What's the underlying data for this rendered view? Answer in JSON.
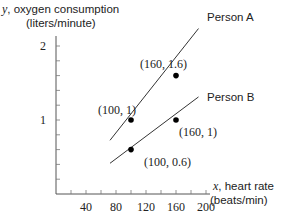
{
  "chart_data": {
    "type": "line",
    "title": "",
    "xlabel": "x, heart rate (beats/min)",
    "ylabel": "y, oxygen consumption (liters/minute)",
    "xlabel_var": "x",
    "xlabel_line1": ", heart rate",
    "xlabel_line2": "(beats/min)",
    "ylabel_var": "y",
    "ylabel_line1": ", oxygen consumption",
    "ylabel_line2": "(liters/minute)",
    "xlim": [
      0,
      200
    ],
    "ylim": [
      0,
      2
    ],
    "x_ticks": [
      20,
      40,
      60,
      80,
      100,
      120,
      140,
      160,
      180,
      200
    ],
    "x_tick_labels": [
      "40",
      "80",
      "120",
      "160",
      "200"
    ],
    "y_ticks": [
      0.2,
      0.4,
      0.6,
      0.8,
      1.0,
      1.2,
      1.4,
      1.6,
      1.8,
      2.0
    ],
    "y_tick_labels": [
      "1",
      "2"
    ],
    "grid": false,
    "series": [
      {
        "name": "Person A",
        "line": [
          [
            70,
            0.7
          ],
          [
            195,
            2.3
          ]
        ],
        "points": [
          {
            "x": 100,
            "y": 1,
            "label": "(100, 1)"
          },
          {
            "x": 160,
            "y": 1.6,
            "label": "(160, 1.6)"
          }
        ]
      },
      {
        "name": "Person B",
        "line": [
          [
            70,
            0.4
          ],
          [
            195,
            1.35
          ]
        ],
        "points": [
          {
            "x": 100,
            "y": 0.6,
            "label": "(100, 0.6)"
          },
          {
            "x": 160,
            "y": 1,
            "label": "(160, 1)"
          }
        ]
      }
    ]
  }
}
